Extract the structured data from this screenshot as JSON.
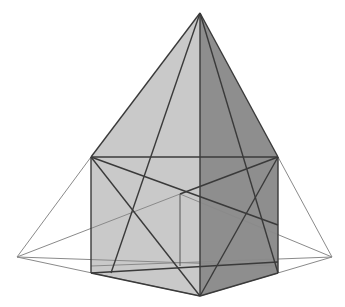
{
  "diagram": {
    "title": "",
    "colors": {
      "left_face": "#c8c8c8",
      "right_face": "#8c8c8c",
      "bottom_face": "#bdbdbd",
      "edge": "#3a3a3a",
      "thin": "#888888"
    }
  }
}
